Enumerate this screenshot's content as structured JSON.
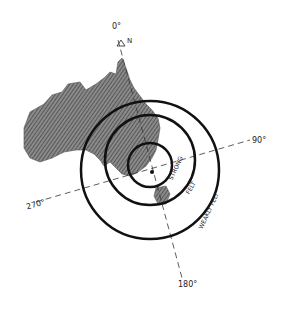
{
  "diagram": {
    "bearings": {
      "north": "0°",
      "east": "90°",
      "south": "180°",
      "west": "270°"
    },
    "north_marker": "N",
    "rings": [
      {
        "label": "STRONG"
      },
      {
        "label": "FELT"
      },
      {
        "label": "WEAKLY FELT"
      }
    ],
    "colors": {
      "land": "#6b6b6b",
      "rings": "#111111",
      "axes": "#333333"
    }
  }
}
